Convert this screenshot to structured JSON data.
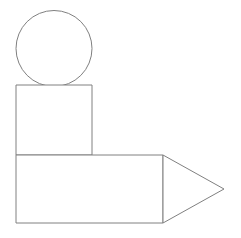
{
  "canvas": {
    "width": 241,
    "height": 238,
    "background_color": "#ffffff",
    "title": "Geometric Shapes Composition"
  },
  "style": {
    "stroke_color": "#808080",
    "stroke_width": 1,
    "fill_color": "#ffffff"
  },
  "shapes": [
    {
      "id": "circle",
      "name": "circle",
      "label": "Circle",
      "type": "circle",
      "cx": 54,
      "cy": 48.5,
      "r": 38,
      "stroke_color": "#808080",
      "fill_color": "#ffffff"
    },
    {
      "id": "square",
      "name": "square",
      "label": "Square",
      "type": "rect",
      "x": 16,
      "y": 85,
      "width": 76,
      "height": 70,
      "stroke_color": "#808080",
      "fill_color": "#ffffff"
    },
    {
      "id": "rectangle",
      "name": "rectangle",
      "label": "Rectangle",
      "type": "rect",
      "x": 16,
      "y": 155,
      "width": 147,
      "height": 68,
      "stroke_color": "#808080",
      "fill_color": "#ffffff"
    },
    {
      "id": "triangle",
      "name": "triangle",
      "label": "Triangle",
      "type": "polygon",
      "points": "163,155 224,189 163,223",
      "stroke_color": "#808080",
      "fill_color": "#ffffff"
    }
  ]
}
